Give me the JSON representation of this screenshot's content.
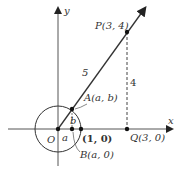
{
  "diagram": {
    "axes": {
      "x_label": "x",
      "y_label": "y"
    },
    "origin_label": "O",
    "points": {
      "P": "P(3, 4)",
      "Q": "Q(3, 0)",
      "A": "A(a, b)",
      "B": "B(a, 0)",
      "unit": "(1, 0)"
    },
    "segment_labels": {
      "hypotenuse": "5",
      "vertical": "4",
      "small_a": "a",
      "small_b": "b"
    },
    "colors": {
      "line": "#222222",
      "text": "#333333"
    }
  }
}
